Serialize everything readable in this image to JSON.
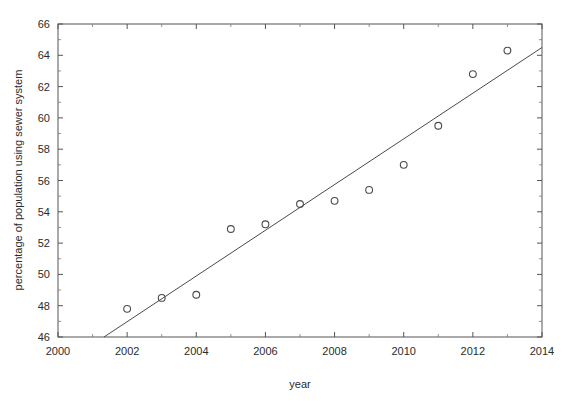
{
  "chart_data": {
    "type": "scatter",
    "title": "",
    "xlabel": "year",
    "ylabel": "percentage of population using sewer system",
    "xlim": [
      2000,
      2014
    ],
    "ylim": [
      46,
      66
    ],
    "grid": false,
    "legend": "none",
    "x": [
      2002,
      2003,
      2004,
      2005,
      2006,
      2007,
      2008,
      2009,
      2010,
      2011,
      2012,
      2013
    ],
    "values": [
      47.8,
      48.5,
      48.7,
      52.9,
      53.2,
      54.5,
      54.7,
      55.4,
      57.0,
      59.5,
      62.8,
      64.3
    ],
    "series": [
      {
        "name": "percentage of population using sewer system",
        "marker": "open-circle",
        "values": [
          47.8,
          48.5,
          48.7,
          52.9,
          53.2,
          54.5,
          54.7,
          55.4,
          57.0,
          59.5,
          62.8,
          64.3
        ]
      },
      {
        "name": "trend line",
        "type": "line",
        "x": [
          2001.33,
          2014.0
        ],
        "values": [
          46.0,
          64.5
        ]
      }
    ],
    "xticks": [
      2000,
      2002,
      2004,
      2006,
      2008,
      2010,
      2012,
      2014
    ],
    "xtick_labels": [
      "2000",
      "2002",
      "2004",
      "2006",
      "2008",
      "2010",
      "2012",
      "2014"
    ],
    "yticks": [
      46,
      48,
      50,
      52,
      54,
      56,
      58,
      60,
      62,
      64,
      66
    ],
    "ytick_labels": [
      "46",
      "48",
      "50",
      "52",
      "54",
      "56",
      "58",
      "60",
      "62",
      "64",
      "66"
    ],
    "xminor_step": 1,
    "yminor_step": 1,
    "colors": {
      "axis": "#555555",
      "marker": "#4a4a4a",
      "trend": "#4a4a4a",
      "background": "#ffffff"
    }
  }
}
